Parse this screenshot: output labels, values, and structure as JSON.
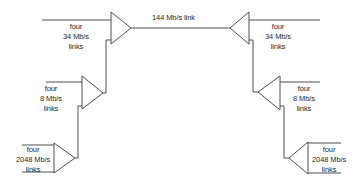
{
  "diagram": {
    "line_color": "#3a3a3a",
    "main_link": {
      "label": "144 Mb/s link"
    },
    "left": {
      "level_34": {
        "line1": "four",
        "line2": "34 Mb/s",
        "line3": "links"
      },
      "level_8": {
        "line1": "four",
        "line2": "8 Mb/s",
        "line3": "links"
      },
      "level_2048": {
        "line1": "four",
        "line2": "2048 Mb/s",
        "line3": "links"
      }
    },
    "right": {
      "level_34": {
        "line1": "four",
        "line2": "34 Mb/s",
        "line3": "links"
      },
      "level_8": {
        "line1": "four",
        "line2": "8 Mb/s",
        "line3": "links"
      },
      "level_2048": {
        "line1": "four",
        "line2": "2048 Mb/s",
        "line3": "links"
      }
    }
  }
}
